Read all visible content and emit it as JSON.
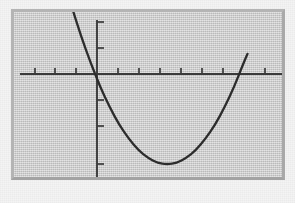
{
  "figure": {
    "title": "",
    "background_color": "#f4f4f4",
    "frame_color": "#c9c9c9",
    "plot_background_color": "#cccccc",
    "curve_color": "#2c2c2c",
    "axis_color": "#3a3a3a",
    "width_px": 295,
    "height_px": 203
  },
  "chart_data": {
    "type": "line",
    "title": "",
    "xlabel": "",
    "ylabel": "",
    "grid": false,
    "legend": null,
    "axis_style": "cartesian-cross-with-ticks",
    "tick_labels_visible": false,
    "xlim": [
      -6,
      8
    ],
    "ylim": [
      -9,
      4
    ],
    "x_ticks": [
      -6,
      -5,
      -4,
      -3,
      -2,
      -1,
      1,
      2,
      3,
      4,
      5,
      6,
      7
    ],
    "y_ticks": [
      -8,
      -6,
      -4,
      2,
      3
    ],
    "curves": [
      {
        "name": "parabola",
        "shape": "upward-parabola",
        "equation": "y = 0.5x^2 - 2x - 6",
        "vertex": [
          2,
          -8
        ],
        "y_intercept": -6,
        "x_intercepts": [
          -2.2,
          5.5
        ],
        "x": [
          -4.2,
          -3.5,
          -3,
          -2.5,
          -2,
          -1.5,
          -1,
          -0.5,
          0,
          0.5,
          1,
          1.5,
          2,
          2.5,
          3,
          3.5,
          4,
          4.5,
          5,
          5.5,
          6,
          6.2
        ],
        "y": [
          11.1,
          7.1,
          4.5,
          2.1,
          0,
          -1.9,
          -3.5,
          -4.9,
          -6,
          -6.9,
          -7.5,
          -7.9,
          -8,
          -7.9,
          -7.5,
          -6.9,
          -6,
          -4.9,
          -3.5,
          -1.9,
          0,
          0.7
        ]
      }
    ]
  }
}
